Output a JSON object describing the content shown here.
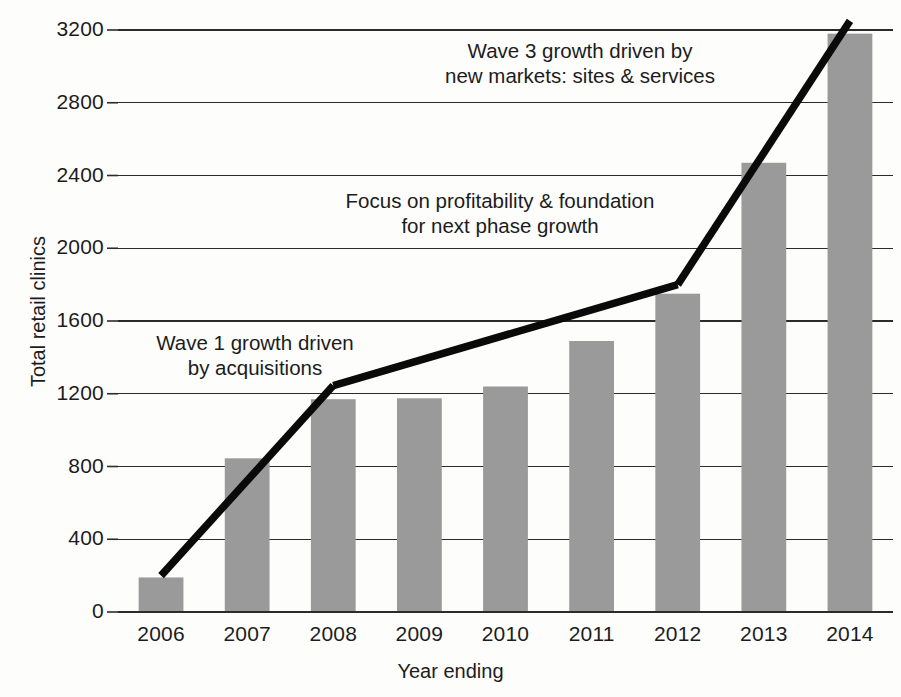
{
  "chart_data": {
    "type": "bar",
    "title": "",
    "xlabel": "Year ending",
    "ylabel": "Total retail clinics",
    "categories": [
      "2006",
      "2007",
      "2008",
      "2009",
      "2010",
      "2011",
      "2012",
      "2013",
      "2014"
    ],
    "values": [
      190,
      845,
      1170,
      1175,
      1240,
      1490,
      1750,
      2470,
      3180
    ],
    "series": [
      {
        "name": "Total retail clinics",
        "values": [
          190,
          845,
          1170,
          1175,
          1240,
          1490,
          1750,
          2470,
          3180
        ]
      }
    ],
    "ylim": [
      0,
      3200
    ],
    "yticks": [
      0,
      400,
      800,
      1200,
      1600,
      2000,
      2400,
      2800,
      3200
    ],
    "ytick_labels": [
      "0",
      "400",
      "800",
      "1200",
      "1600",
      "2000",
      "2400",
      "2800",
      "3200"
    ],
    "grid": true,
    "grid_axis": "y",
    "legend": false,
    "legend_position": "none",
    "bar_color": "#9a9a9a",
    "trend_color": "#0a0a0a",
    "trendlines": [
      {
        "name": "wave-1-segment",
        "from": {
          "x": "2006",
          "y": 200
        },
        "to": {
          "x": "2008",
          "y": 1245
        }
      },
      {
        "name": "plateau-segment",
        "from": {
          "x": "2008",
          "y": 1245
        },
        "to": {
          "x": "2012",
          "y": 1800
        }
      },
      {
        "name": "wave-3-segment",
        "from": {
          "x": "2012",
          "y": 1800
        },
        "to": {
          "x": "2014",
          "y": 3250
        }
      }
    ],
    "annotations": [
      {
        "name": "wave-1-annotation",
        "lines": [
          "Wave 1 growth driven",
          "by acquisitions"
        ]
      },
      {
        "name": "profitability-annotation",
        "lines": [
          "Focus on profitability & foundation",
          "for next phase growth"
        ]
      },
      {
        "name": "wave-3-annotation",
        "lines": [
          "Wave 3 growth driven by",
          "new markets: sites & services"
        ]
      }
    ]
  },
  "axes": {
    "y_label": "Total retail clinics",
    "x_label": "Year ending",
    "y_ticks": [
      "3200",
      "2800",
      "2400",
      "2000",
      "1600",
      "1200",
      "800",
      "400",
      "0"
    ],
    "x_ticks": [
      "2006",
      "2007",
      "2008",
      "2009",
      "2010",
      "2011",
      "2012",
      "2013",
      "2014"
    ]
  },
  "annotations": {
    "wave1": {
      "line1": "Wave 1 growth driven",
      "line2": "by acquisitions"
    },
    "focus": {
      "line1": "Focus on profitability & foundation",
      "line2": "for next phase growth"
    },
    "wave3": {
      "line1": "Wave 3 growth driven by",
      "line2": "new markets: sites & services"
    }
  },
  "colors": {
    "bar": "#9a9a9a",
    "trend": "#0a0a0a",
    "grid": "#2b2b2b",
    "text": "#1c1c1c",
    "background": "#fdfdfc"
  }
}
